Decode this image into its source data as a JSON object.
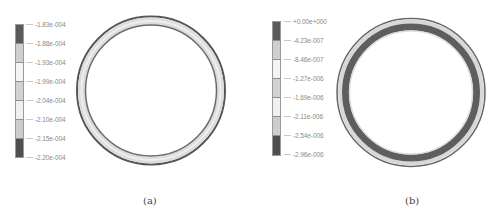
{
  "figure": {
    "panels": [
      {
        "id": "a",
        "caption": "(a)",
        "legend": {
          "labels": [
            "-1.83e-004",
            "-1.88e-004",
            "-1.93e-004",
            "-1.99e-004",
            "-2.04e-004",
            "-2.10e-004",
            "-2.15e-004",
            "-2.20e-004"
          ],
          "segment_colors": [
            "#5a5a5a",
            "#cfcfcf",
            "#f4f4f4",
            "#d2d2d2",
            "#f0f0f0",
            "#cdcdcd",
            "#4e4e4e"
          ]
        },
        "ring": {
          "description": "Circular cross-section contour plot, mostly light gray band",
          "outer_edge_color": "#555555",
          "band_color": "#dcdcdc",
          "inner_edge_color": "#6a6a6a"
        }
      },
      {
        "id": "b",
        "caption": "(b)",
        "legend": {
          "labels": [
            "+0.00e+000",
            "-4.23e-007",
            "-8.46e-007",
            "-1.27e-006",
            "-1.69e-006",
            "-2.11e-006",
            "-2.54e-006",
            "-2.96e-006"
          ],
          "segment_colors": [
            "#5a5a5a",
            "#cfcfcf",
            "#f4f4f4",
            "#d2d2d2",
            "#f0f0f0",
            "#cdcdcd",
            "#4e4e4e"
          ]
        },
        "ring": {
          "description": "Circular cross-section contour plot, thick dark inner band with light outer band",
          "outer_edge_color": "#666666",
          "outer_band_color": "#d8d8d8",
          "inner_band_color": "#5e5e5e",
          "inner_edge_color": "#dddddd"
        }
      }
    ]
  }
}
